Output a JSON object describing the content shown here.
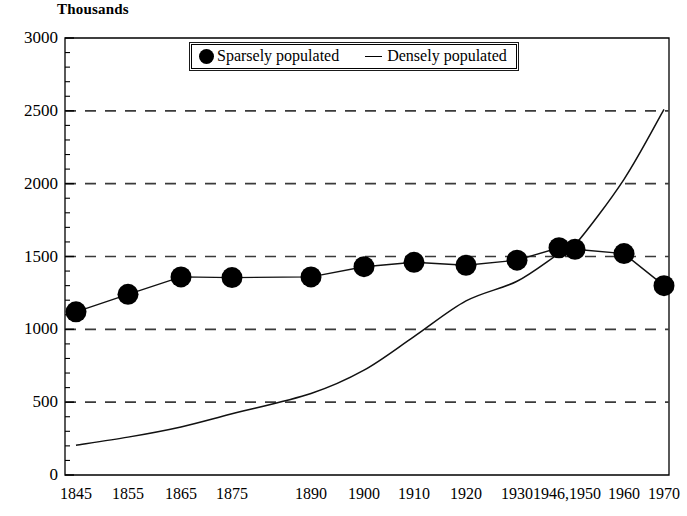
{
  "chart_data": {
    "type": "line",
    "title": "Thousands",
    "xlabel": "",
    "ylabel": "Thousands",
    "ylim": [
      0,
      3000
    ],
    "ytick_labels": [
      "0",
      "500",
      "1000",
      "1500",
      "2000",
      "2500",
      "3000"
    ],
    "ytick_values": [
      0,
      500,
      1000,
      1500,
      2000,
      2500,
      3000
    ],
    "ytick_minor_step": 100,
    "gridlines": [
      500,
      1000,
      1500,
      2000,
      2500
    ],
    "grid": "horizontal-dashed",
    "legend_position": "top-center",
    "categories": [
      "1845",
      "1855",
      "1865",
      "1875",
      "1890",
      "1900",
      "1910",
      "1920",
      "1930",
      "1946",
      "1950",
      "1960",
      "1970"
    ],
    "xtick_labels": [
      "1845",
      "1855",
      "1865",
      "1875",
      "1890",
      "1900",
      "1910",
      "1920",
      "1930",
      "1946,1950",
      "1960",
      "1970"
    ],
    "series": [
      {
        "name": "Sparsely populated",
        "marker": "filled-circle",
        "values": [
          1120,
          1240,
          1360,
          1355,
          1360,
          1430,
          1460,
          1440,
          1475,
          1560,
          1550,
          1520,
          1300
        ]
      },
      {
        "name": "Densely populated",
        "marker": "line",
        "values": [
          205,
          260,
          330,
          420,
          560,
          720,
          950,
          1195,
          1330,
          1520,
          1580,
          2030,
          2510
        ]
      }
    ]
  },
  "legend": {
    "items": [
      {
        "label": "Sparsely populated",
        "marker": "filled-circle"
      },
      {
        "label": "Densely populated",
        "marker": "line"
      }
    ]
  },
  "axis": {
    "title": "Thousands"
  }
}
